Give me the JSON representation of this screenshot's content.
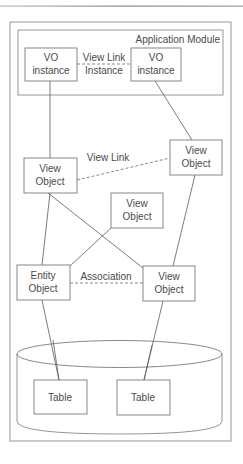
{
  "diagram": {
    "container_label": "Application Module",
    "nodes": {
      "vo_instance_left": {
        "line1": "VO",
        "line2": "instance"
      },
      "vo_instance_right": {
        "line1": "VO",
        "line2": "instance"
      },
      "view_object_left": {
        "line1": "View",
        "line2": "Object"
      },
      "view_object_right": {
        "line1": "View",
        "line2": "Object"
      },
      "view_object_middle": {
        "line1": "View",
        "line2": "Object"
      },
      "entity_object": {
        "line1": "Entity",
        "line2": "Object"
      },
      "view_object_bottom": {
        "line1": "View",
        "line2": "Object"
      },
      "table_left": {
        "label": "Table"
      },
      "table_right": {
        "label": "Table"
      }
    },
    "edges": {
      "view_link_instance": {
        "line1": "View Link",
        "line2": "Instance"
      },
      "view_link": {
        "label": "View Link"
      },
      "association": {
        "label": "Association"
      }
    },
    "colors": {
      "stroke": "#7a7a7a",
      "text": "#4a4a4a",
      "background": "#ffffff"
    }
  }
}
